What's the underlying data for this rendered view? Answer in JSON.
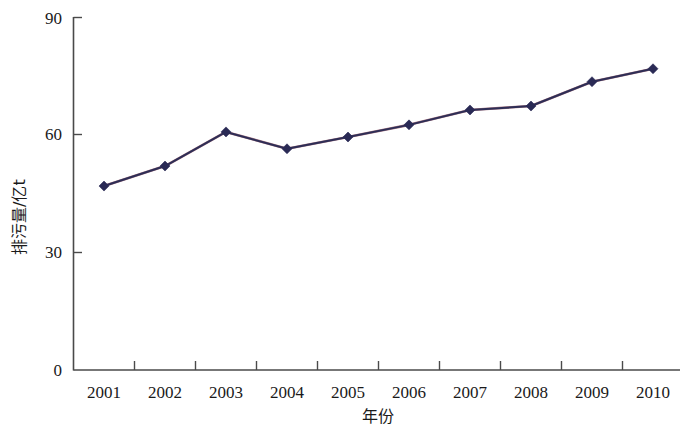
{
  "chart_data": {
    "type": "line",
    "title": "",
    "xlabel": "年份",
    "ylabel": "排污量/亿t",
    "categories": [
      "2001",
      "2002",
      "2003",
      "2004",
      "2005",
      "2006",
      "2007",
      "2008",
      "2009",
      "2010"
    ],
    "values": [
      46.9,
      52.0,
      60.7,
      56.4,
      59.4,
      62.5,
      66.3,
      67.3,
      73.5,
      76.8
    ],
    "series": [
      {
        "name": "排污量",
        "values": [
          46.9,
          52.0,
          60.7,
          56.4,
          59.4,
          62.5,
          66.3,
          67.3,
          73.5,
          76.8
        ]
      }
    ],
    "ylim": [
      0,
      90
    ],
    "yticks": [
      0,
      30,
      60,
      90
    ],
    "ytick_labels": [
      "0",
      "30",
      "60",
      "90"
    ],
    "grid": false,
    "legend": false,
    "legend_position": "none",
    "marker": "diamond",
    "line_color": "#2e2e56",
    "marker_color": "#2a2a55",
    "axis_color": "#4a4a4a",
    "background": "#ffffff"
  },
  "axes": {
    "y_title": "排污量/亿t",
    "x_title": "年份",
    "y_ticks": [
      {
        "label": "90",
        "value": 90
      },
      {
        "label": "60",
        "value": 60
      },
      {
        "label": "30",
        "value": 30
      },
      {
        "label": "0",
        "value": 0
      }
    ],
    "x_ticks": [
      {
        "label": "2001"
      },
      {
        "label": "2002"
      },
      {
        "label": "2003"
      },
      {
        "label": "2004"
      },
      {
        "label": "2005"
      },
      {
        "label": "2006"
      },
      {
        "label": "2007"
      },
      {
        "label": "2008"
      },
      {
        "label": "2009"
      },
      {
        "label": "2010"
      }
    ]
  }
}
